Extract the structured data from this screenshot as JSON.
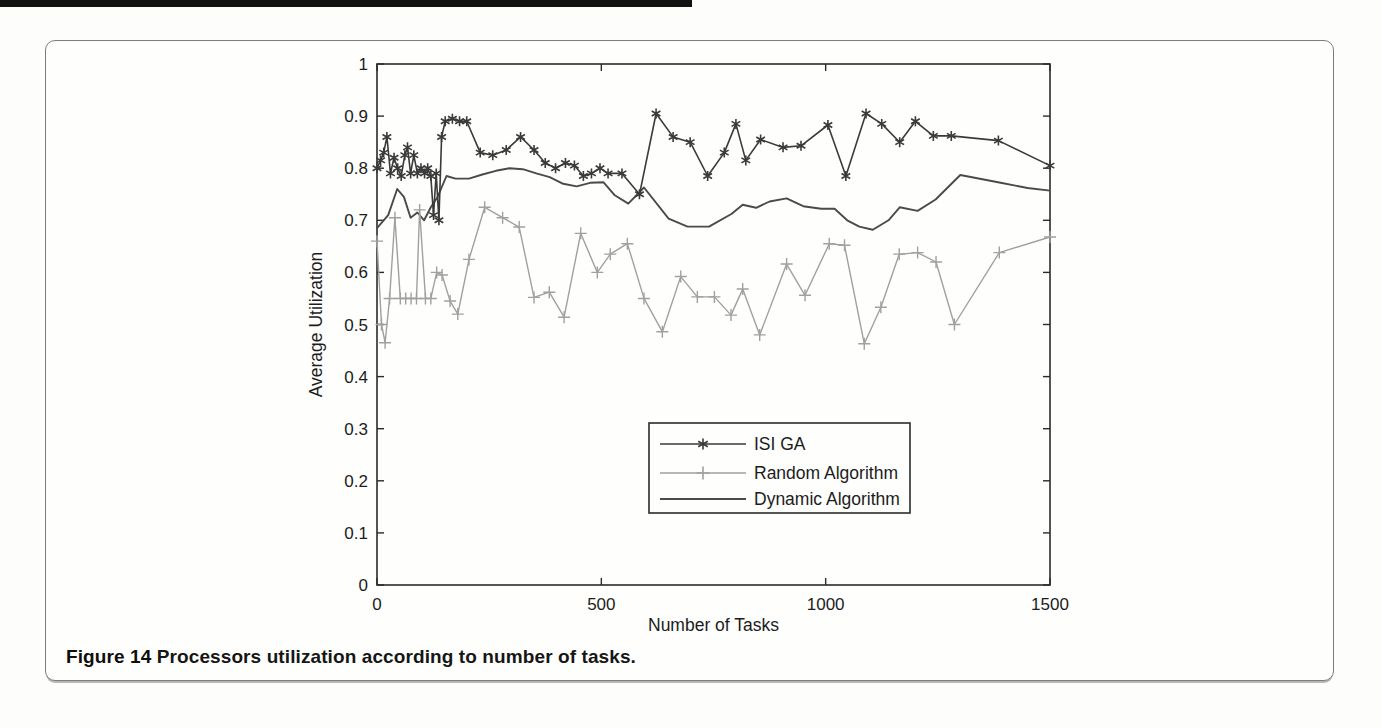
{
  "figure": {
    "caption_label": "Figure 14",
    "caption_text": " Processors utilization according to number of tasks."
  },
  "colors": {
    "axis": "#2b2b2b",
    "text": "#1c1c1c",
    "isi_ga": "#3a3a3a",
    "random": "#a0a0a0",
    "dynamic": "#4a4a4a",
    "legend_border": "#2b2b2b",
    "card_border": "#7d7d7d"
  },
  "chart_data": {
    "type": "line",
    "title": "",
    "xlabel": "Number of Tasks",
    "ylabel": "Average Utilization",
    "xlim": [
      0,
      1500
    ],
    "ylim": [
      0,
      1
    ],
    "x_ticks": [
      0,
      500,
      1000,
      1500
    ],
    "x_tick_labels": [
      "0",
      "500",
      "1000",
      "1500"
    ],
    "y_ticks": [
      0,
      0.1,
      0.2,
      0.3,
      0.4,
      0.5,
      0.6,
      0.7,
      0.8,
      0.9,
      1
    ],
    "y_tick_labels": [
      "0",
      "0.1",
      "0.2",
      "0.3",
      "0.4",
      "0.5",
      "0.6",
      "0.7",
      "0.8",
      "0.9",
      "1"
    ],
    "grid": false,
    "legend_position": "inside-lower-middle",
    "values_note": "values estimated from scanned plot",
    "series": [
      {
        "name": "ISI GA",
        "marker": "asterisk",
        "color_key": "isi_ga",
        "points": [
          [
            0,
            0.8
          ],
          [
            8,
            0.815
          ],
          [
            15,
            0.83
          ],
          [
            22,
            0.86
          ],
          [
            30,
            0.79
          ],
          [
            38,
            0.82
          ],
          [
            46,
            0.8
          ],
          [
            54,
            0.785
          ],
          [
            62,
            0.825
          ],
          [
            68,
            0.84
          ],
          [
            75,
            0.79
          ],
          [
            82,
            0.825
          ],
          [
            90,
            0.79
          ],
          [
            98,
            0.8
          ],
          [
            106,
            0.79
          ],
          [
            113,
            0.8
          ],
          [
            120,
            0.785
          ],
          [
            126,
            0.71
          ],
          [
            132,
            0.79
          ],
          [
            138,
            0.7
          ],
          [
            144,
            0.86
          ],
          [
            152,
            0.89
          ],
          [
            168,
            0.895
          ],
          [
            184,
            0.89
          ],
          [
            200,
            0.89
          ],
          [
            230,
            0.83
          ],
          [
            258,
            0.825
          ],
          [
            288,
            0.835
          ],
          [
            320,
            0.86
          ],
          [
            350,
            0.835
          ],
          [
            375,
            0.81
          ],
          [
            398,
            0.8
          ],
          [
            420,
            0.81
          ],
          [
            440,
            0.805
          ],
          [
            460,
            0.785
          ],
          [
            478,
            0.79
          ],
          [
            497,
            0.8
          ],
          [
            515,
            0.79
          ],
          [
            546,
            0.79
          ],
          [
            585,
            0.75
          ],
          [
            622,
            0.905
          ],
          [
            660,
            0.86
          ],
          [
            698,
            0.85
          ],
          [
            737,
            0.785
          ],
          [
            774,
            0.83
          ],
          [
            800,
            0.885
          ],
          [
            822,
            0.815
          ],
          [
            855,
            0.855
          ],
          [
            905,
            0.84
          ],
          [
            945,
            0.843
          ],
          [
            1005,
            0.883
          ],
          [
            1045,
            0.785
          ],
          [
            1090,
            0.905
          ],
          [
            1125,
            0.885
          ],
          [
            1165,
            0.85
          ],
          [
            1200,
            0.89
          ],
          [
            1240,
            0.862
          ],
          [
            1280,
            0.862
          ],
          [
            1385,
            0.853
          ],
          [
            1500,
            0.805
          ]
        ]
      },
      {
        "name": "Random Algorithm",
        "marker": "plus",
        "color_key": "random",
        "points": [
          [
            0,
            0.66
          ],
          [
            10,
            0.5
          ],
          [
            18,
            0.465
          ],
          [
            28,
            0.55
          ],
          [
            40,
            0.705
          ],
          [
            52,
            0.55
          ],
          [
            64,
            0.55
          ],
          [
            76,
            0.55
          ],
          [
            88,
            0.55
          ],
          [
            95,
            0.72
          ],
          [
            108,
            0.55
          ],
          [
            120,
            0.55
          ],
          [
            133,
            0.6
          ],
          [
            145,
            0.595
          ],
          [
            163,
            0.545
          ],
          [
            180,
            0.52
          ],
          [
            205,
            0.625
          ],
          [
            240,
            0.725
          ],
          [
            280,
            0.705
          ],
          [
            317,
            0.687
          ],
          [
            350,
            0.552
          ],
          [
            384,
            0.562
          ],
          [
            417,
            0.514
          ],
          [
            454,
            0.675
          ],
          [
            491,
            0.6
          ],
          [
            520,
            0.635
          ],
          [
            558,
            0.655
          ],
          [
            595,
            0.55
          ],
          [
            636,
            0.486
          ],
          [
            677,
            0.592
          ],
          [
            714,
            0.553
          ],
          [
            752,
            0.553
          ],
          [
            789,
            0.518
          ],
          [
            815,
            0.568
          ],
          [
            853,
            0.48
          ],
          [
            913,
            0.616
          ],
          [
            954,
            0.556
          ],
          [
            1008,
            0.655
          ],
          [
            1042,
            0.652
          ],
          [
            1086,
            0.463
          ],
          [
            1123,
            0.533
          ],
          [
            1164,
            0.635
          ],
          [
            1205,
            0.638
          ],
          [
            1246,
            0.62
          ],
          [
            1287,
            0.5
          ],
          [
            1387,
            0.638
          ],
          [
            1500,
            0.668
          ]
        ]
      },
      {
        "name": "Dynamic Algorithm",
        "marker": "none",
        "color_key": "dynamic",
        "points": [
          [
            0,
            0.685
          ],
          [
            25,
            0.71
          ],
          [
            45,
            0.76
          ],
          [
            60,
            0.745
          ],
          [
            75,
            0.705
          ],
          [
            90,
            0.715
          ],
          [
            105,
            0.7
          ],
          [
            120,
            0.725
          ],
          [
            135,
            0.745
          ],
          [
            155,
            0.785
          ],
          [
            175,
            0.78
          ],
          [
            205,
            0.78
          ],
          [
            235,
            0.788
          ],
          [
            265,
            0.795
          ],
          [
            295,
            0.8
          ],
          [
            325,
            0.798
          ],
          [
            355,
            0.79
          ],
          [
            385,
            0.783
          ],
          [
            415,
            0.77
          ],
          [
            445,
            0.765
          ],
          [
            475,
            0.772
          ],
          [
            505,
            0.773
          ],
          [
            530,
            0.748
          ],
          [
            560,
            0.732
          ],
          [
            595,
            0.763
          ],
          [
            650,
            0.703
          ],
          [
            692,
            0.688
          ],
          [
            740,
            0.688
          ],
          [
            790,
            0.712
          ],
          [
            815,
            0.73
          ],
          [
            845,
            0.724
          ],
          [
            875,
            0.736
          ],
          [
            913,
            0.742
          ],
          [
            950,
            0.727
          ],
          [
            990,
            0.722
          ],
          [
            1020,
            0.722
          ],
          [
            1048,
            0.7
          ],
          [
            1075,
            0.688
          ],
          [
            1105,
            0.682
          ],
          [
            1140,
            0.7
          ],
          [
            1165,
            0.725
          ],
          [
            1205,
            0.718
          ],
          [
            1245,
            0.74
          ],
          [
            1300,
            0.787
          ],
          [
            1390,
            0.772
          ],
          [
            1450,
            0.762
          ],
          [
            1500,
            0.757
          ]
        ]
      }
    ]
  }
}
